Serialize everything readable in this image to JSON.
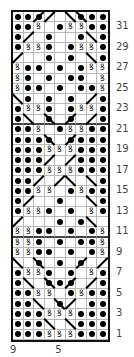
{
  "chart": {
    "title_cut": "· · · · · · · · ·",
    "columns": 9,
    "rows": 32,
    "legend_symbols": {
      "p": "purl-dot",
      "k": "knit-blank",
      "t": "twisted-stitch",
      "r": "right-leaning-line",
      "l": "left-leaning-line",
      "rp": "right-leaning-line-with-dot",
      "lp": "left-leaning-line-with-dot"
    },
    "grid_rows_top_to_bottom": [
      [
        "p",
        "p",
        "rp",
        "r",
        "k",
        "l",
        "lp",
        "p",
        "p"
      ],
      [
        "p",
        "p",
        "t",
        "k",
        "p",
        "t",
        "t",
        "p",
        "p"
      ],
      [
        "p",
        "r",
        "k",
        "p",
        "k",
        "k",
        "p",
        "l",
        "p"
      ],
      [
        "p",
        "t",
        "t",
        "p",
        "k",
        "p",
        "t",
        "t",
        "p"
      ],
      [
        "r",
        "k",
        "k",
        "p",
        "k",
        "p",
        "k",
        "l",
        "p"
      ],
      [
        "t",
        "p",
        "p",
        "k",
        "p",
        "k",
        "p",
        "t",
        "t"
      ],
      [
        "t",
        "p",
        "k",
        "p",
        "k",
        "p",
        "p",
        "k",
        "t"
      ],
      [
        "t",
        "p",
        "p",
        "k",
        "p",
        "k",
        "p",
        "p",
        "t"
      ],
      [
        "l",
        "p",
        "k",
        "p",
        "k",
        "p",
        "k",
        "r",
        "p"
      ],
      [
        "p",
        "t",
        "t",
        "p",
        "k",
        "p",
        "t",
        "t",
        "p"
      ],
      [
        "p",
        "l",
        "k",
        "lp",
        "k",
        "rp",
        "k",
        "r",
        "p"
      ],
      [
        "p",
        "p",
        "t",
        "k",
        "p",
        "t",
        "t",
        "p",
        "p"
      ],
      [
        "p",
        "p",
        "p",
        "lp",
        "k",
        "rp",
        "p",
        "p",
        "p"
      ],
      [
        "p",
        "p",
        "p",
        "t",
        "t",
        "t",
        "p",
        "p",
        "p"
      ],
      [
        "p",
        "p",
        "p",
        "r",
        "k",
        "r",
        "p",
        "p",
        "p"
      ],
      [
        "p",
        "p",
        "p",
        "t",
        "t",
        "t",
        "p",
        "p",
        "p"
      ],
      [
        "p",
        "p",
        "r",
        "k",
        "r",
        "l",
        "k",
        "l",
        "p"
      ],
      [
        "p",
        "p",
        "t",
        "t",
        "k",
        "p",
        "t",
        "p",
        "p"
      ],
      [
        "p",
        "r",
        "k",
        "k",
        "p",
        "k",
        "k",
        "l",
        "p"
      ],
      [
        "p",
        "t",
        "t",
        "p",
        "k",
        "p",
        "k",
        "t",
        "p"
      ],
      [
        "r",
        "k",
        "k",
        "k",
        "p",
        "k",
        "p",
        "l",
        "k"
      ],
      [
        "t",
        "t",
        "p",
        "p",
        "k",
        "p",
        "k",
        "p",
        "t"
      ],
      [
        "t",
        "t",
        "p",
        "k",
        "p",
        "k",
        "p",
        "p",
        "t"
      ],
      [
        "t",
        "t",
        "p",
        "p",
        "k",
        "p",
        "k",
        "p",
        "t"
      ],
      [
        "l",
        "k",
        "lp",
        "k",
        "p",
        "k",
        "rp",
        "k",
        "r"
      ],
      [
        "p",
        "t",
        "t",
        "p",
        "k",
        "p",
        "k",
        "t",
        "p"
      ],
      [
        "p",
        "l",
        "k",
        "lp",
        "p",
        "rp",
        "k",
        "r",
        "p"
      ],
      [
        "p",
        "p",
        "t",
        "t",
        "k",
        "p",
        "t",
        "p",
        "p"
      ],
      [
        "p",
        "p",
        "l",
        "k",
        "lp",
        "r",
        "k",
        "p",
        "p"
      ],
      [
        "p",
        "p",
        "p",
        "t",
        "t",
        "t",
        "p",
        "p",
        "p"
      ],
      [
        "p",
        "p",
        "p",
        "l",
        "k",
        "l",
        "p",
        "p",
        "p"
      ],
      [
        "p",
        "p",
        "p",
        "t",
        "t",
        "t",
        "p",
        "p",
        "p"
      ]
    ],
    "row_labels": [
      "31",
      "29",
      "27",
      "25",
      "23",
      "21",
      "19",
      "17",
      "15",
      "13",
      "11",
      "9",
      "7",
      "5",
      "3",
      "1"
    ],
    "column_labels": [
      {
        "label": "9",
        "col": 1
      },
      {
        "label": "5",
        "col": 5
      }
    ],
    "thick_line_after_row_index_from_top": [
      10,
      21
    ]
  }
}
